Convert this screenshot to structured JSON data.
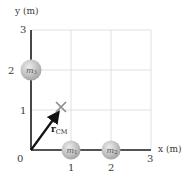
{
  "diagram": {
    "type": "center-of-mass coordinate diagram",
    "axes": {
      "x_title": "x (m)",
      "y_title": "y (m)",
      "x_ticks": [
        "0",
        "1",
        "2",
        "3"
      ],
      "y_ticks": [
        "1",
        "2",
        "3"
      ],
      "origin_label": "0",
      "range": {
        "x": [
          0,
          3
        ],
        "y": [
          0,
          3
        ]
      },
      "grid": true
    },
    "masses": [
      {
        "id": "m1",
        "symbol": "m",
        "subscript": "1",
        "x": 1,
        "y": 0
      },
      {
        "id": "m2",
        "symbol": "m",
        "subscript": "2",
        "x": 2,
        "y": 0
      },
      {
        "id": "m3",
        "symbol": "m",
        "subscript": "3",
        "x": 0,
        "y": 2
      }
    ],
    "center_of_mass": {
      "marker": "×",
      "vector_symbol": "r",
      "vector_arrow": "→",
      "vector_subscript": "CM",
      "x": 0.75,
      "y": 1.0
    },
    "colors": {
      "axis": "#1a1a1a",
      "grid": "#d8d8d8",
      "mass_fill": "#bdbdbd",
      "mass_highlight": "#e6e6e6",
      "vector": "#111111",
      "cm_marker": "#8a8a8a"
    }
  }
}
